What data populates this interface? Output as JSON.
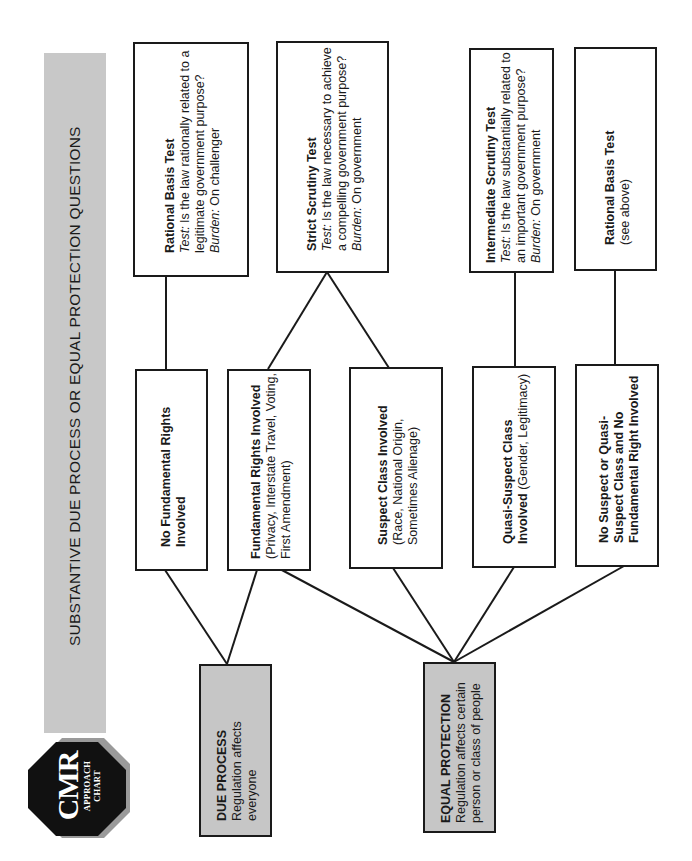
{
  "header": {
    "title": "SUBSTANTIVE DUE PROCESS OR EQUAL PROTECTION QUESTIONS",
    "logo": {
      "main": "CMR",
      "line1": "APPROACH",
      "line2": "CHART"
    }
  },
  "roots": {
    "due_process": {
      "title": "DUE PROCESS",
      "desc": "Regulation affects everyone"
    },
    "equal_protection": {
      "title": "EQUAL PROTECTION",
      "desc": "Regulation affects certain person or class of people"
    }
  },
  "categories": {
    "no_fundamental": {
      "bold": "No Fundamental Rights Involved",
      "rest": ""
    },
    "fundamental": {
      "bold": "Fundamental Rights Involved",
      "rest": " (Privacy, Interstate Travel, Voting, First Amendment)"
    },
    "suspect": {
      "bold": "Suspect Class Involved",
      "rest": "(Race, National Origin, Sometimes Alienage)"
    },
    "quasi_suspect": {
      "bold": "Quasi-Suspect Class Involved",
      "rest": " (Gender, Legitimacy)"
    },
    "no_suspect": {
      "bold": "No Suspect or Quasi-Suspect Class and No Fundamental Right Involved",
      "rest": ""
    }
  },
  "tests": {
    "rational_basis": {
      "title": "Rational Basis Test",
      "test_label": "Test:",
      "test_text": " Is the law rationally related to a legitimate government purpose?",
      "burden_label": "Burden:",
      "burden_text": " On challenger"
    },
    "strict_scrutiny": {
      "title": "Strict Scrutiny Test",
      "test_label": "Test:",
      "test_text": " Is the law necessary to achieve a compelling government purpose?",
      "burden_label": "Burden:",
      "burden_text": " On government"
    },
    "intermediate_scrutiny": {
      "title": "Intermediate Scrutiny Test",
      "test_label": "Test:",
      "test_text": " Is the law substantially related to an important government purpose?",
      "burden_label": "Burden:",
      "burden_text": " On government"
    },
    "rational_basis_2": {
      "title": "Rational Basis Test",
      "note": "(see above)"
    }
  },
  "colors": {
    "title_bar": "#c8c8c8",
    "root_fill": "#c6c6c6",
    "line": "#1a1a1a",
    "logo_fill": "#111111",
    "logo_shadow": "#9a9a9a"
  }
}
